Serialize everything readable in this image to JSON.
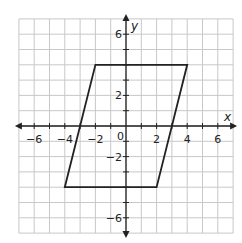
{
  "chart_data": {
    "type": "coordinate-plane",
    "xlabel": "x",
    "ylabel": "y",
    "xlim": [
      -7,
      7
    ],
    "ylim": [
      -7,
      7
    ],
    "grid": true,
    "grid_step": 1,
    "x_tick_labels": [
      "−6",
      "−4",
      "−2",
      "2",
      "4",
      "6"
    ],
    "x_tick_values": [
      -6,
      -4,
      -2,
      2,
      4,
      6
    ],
    "y_tick_labels": [
      "6",
      "2",
      "−2",
      "−6"
    ],
    "y_tick_values": [
      6,
      2,
      -2,
      -6
    ],
    "origin_label": "0",
    "shapes": [
      {
        "type": "parallelogram",
        "vertices": [
          [
            -2,
            4
          ],
          [
            4,
            4
          ],
          [
            2,
            -4
          ],
          [
            -4,
            -4
          ]
        ]
      }
    ]
  },
  "labels": {
    "x_axis": "x",
    "y_axis": "y",
    "origin": "0",
    "x_ticks": [
      "−6",
      "−4",
      "−2",
      "2",
      "4",
      "6"
    ],
    "y_ticks": [
      "6",
      "2",
      "−2",
      "−6"
    ]
  },
  "colors": {
    "grid": "#c8c8c8",
    "axis": "#222222",
    "shape": "#222222"
  }
}
